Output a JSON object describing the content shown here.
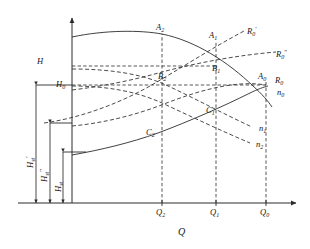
{
  "figure": {
    "type": "technical-line-diagram",
    "axes": {
      "y_axis_label": "H",
      "x_axis_label": "Q",
      "x_ticks": [
        "Q2",
        "Q1",
        "Q0"
      ],
      "y_marked_level": "H0"
    },
    "labels": {
      "H": "H",
      "H0": "H",
      "H0_sub": "0",
      "Q": "Q",
      "Q0": "Q",
      "Q0_sub": "0",
      "Q1": "Q",
      "Q1_sub": "1",
      "Q2": "Q",
      "Q2_sub": "2",
      "A0": "A",
      "A0_sub": "0",
      "A1": "A",
      "A1_sub": "1",
      "A2": "A",
      "A2_sub": "2",
      "B1": "B",
      "B1_sub": "1",
      "B2": "B",
      "B2_sub": "2",
      "C1": "C",
      "C1_sub": "1",
      "C2": "C",
      "C2_sub": "2",
      "R0": "R",
      "R0_sub": "0",
      "R0p": "R",
      "R0p_sub": "0",
      "R0p_sup": "′",
      "R0pp": "R",
      "R0pp_sub": "0",
      "R0pp_sup": "″",
      "n0": "n",
      "n0_sub": "0",
      "n1": "n",
      "n1_sub": "1",
      "n2": "n",
      "n2_sub": "2",
      "Hst": "H",
      "Hst_sub": "st",
      "Hstp": "H",
      "Hstp_sub": "st",
      "Hstp_sup": "′",
      "Hstpp": "H",
      "Hstpp_sub": "st",
      "Hstpp_sup": "″"
    },
    "colors": {
      "line": "#2b2b2b",
      "background": "#ffffff",
      "text": "#161616"
    },
    "points": [
      {
        "name": "A2",
        "x": "Q2",
        "note": "on pump curve n0"
      },
      {
        "name": "A1",
        "x": "Q1",
        "note": "intersection of n0 curve and R0-prime"
      },
      {
        "name": "A0",
        "x": "Q0",
        "note": "rated duty point"
      },
      {
        "name": "B2",
        "x": "Q2",
        "note": "on R0-double-prime resistance curve"
      },
      {
        "name": "B1",
        "x": "Q1",
        "note": "on H0 level line"
      },
      {
        "name": "C2",
        "x": "Q2",
        "note": "lower pump curve"
      },
      {
        "name": "C1",
        "x": "Q1",
        "note": "lower pump curve"
      }
    ],
    "speed_curves": [
      "n0",
      "n1",
      "n2"
    ],
    "resistance_curves": [
      "R0",
      "R0′",
      "R0″"
    ],
    "static_heads": [
      "Hst",
      "Hst″",
      "Hst′"
    ]
  }
}
